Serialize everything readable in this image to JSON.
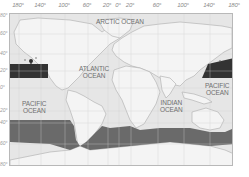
{
  "map": {
    "type": "world-map",
    "longitude_labels": [
      "180°",
      "140°",
      "100°",
      "60°",
      "20°",
      "0°",
      "20°",
      "60°",
      "100°",
      "140°",
      "180°"
    ],
    "latitude_labels": [
      "80°",
      "60°",
      "40°",
      "20°",
      "0°",
      "20°",
      "40°",
      "60°",
      "80°"
    ],
    "oceans": {
      "arctic": "ARCTIC OCEAN",
      "atlantic_line1": "ATLANTIC",
      "atlantic_line2": "OCEAN",
      "pacific_west_line1": "PACIFIC",
      "pacific_west_line2": "OCEAN",
      "pacific_east_line1": "PACIFIC",
      "pacific_east_line2": "OCEAN",
      "indian_line1": "INDIAN",
      "indian_line2": "OCEAN"
    },
    "highlighted_zones": [
      {
        "name": "north-pacific-band",
        "color": "#3a3a3a"
      },
      {
        "name": "southern-ocean-band",
        "color": "#6e6e6e"
      }
    ],
    "colors": {
      "land": "#f4f4f4",
      "ocean": "#e4e4e4",
      "coast": "#b0b0b0",
      "grid": "#d0d0d0",
      "north_band": "#333333",
      "south_band": "#6a6a6a"
    },
    "marker": "location-marker-hawaii"
  }
}
